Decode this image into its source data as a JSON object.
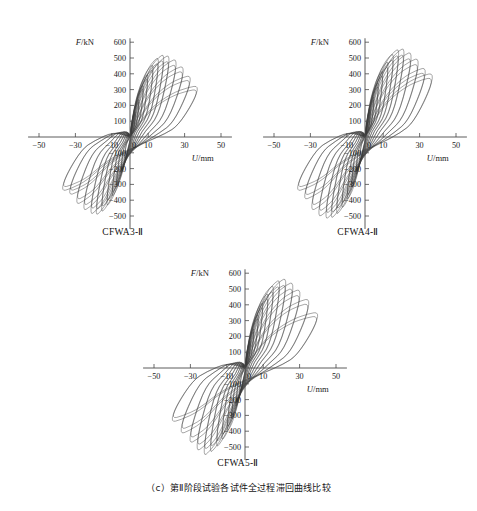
{
  "figure": {
    "caption": "（c）第Ⅱ阶段试验各试件全过程滞回曲线比较",
    "caption_label": "(c)",
    "background": "#ffffff",
    "line_color": "#3a3a3a",
    "axis_color": "#4a4a4a"
  },
  "panels": [
    {
      "id": "a",
      "title": "CFWA3-Ⅱ"
    },
    {
      "id": "b",
      "title": "CFWA4-Ⅱ"
    },
    {
      "id": "c",
      "title": "CFWA5-Ⅱ"
    }
  ],
  "axes": {
    "y_title": "F/kN",
    "x_title": "U/mm",
    "y_ticks": [
      600,
      500,
      400,
      300,
      200,
      100,
      -100,
      -200,
      -300,
      -400,
      -500,
      -600
    ],
    "y_tick_labels": [
      "600",
      "500",
      "400",
      "300",
      "200",
      "100",
      "-100",
      "-200",
      "-300",
      "-400",
      "-500",
      "-600"
    ],
    "x_ticks": [
      -50,
      -30,
      -10,
      0,
      10,
      30,
      50
    ],
    "x_tick_labels": [
      "-50",
      "-30",
      "-10",
      "0",
      "10",
      "30",
      "50"
    ],
    "xlim": [
      -55,
      55
    ],
    "ylim": [
      -620,
      620
    ]
  },
  "chart_data": [
    {
      "type": "line",
      "title": "CFWA3-Ⅱ",
      "xlabel": "U/mm",
      "ylabel": "F/kN",
      "xlim": [
        -55,
        55
      ],
      "ylim": [
        -620,
        620
      ],
      "grid": false,
      "legend": "none",
      "description": "Full-process hysteretic load-displacement loops, stage II test",
      "loops": [
        {
          "cycle": 1,
          "peak_disp_pos": 3.0,
          "peak_force_pos": 160,
          "peak_disp_neg": -3.0,
          "peak_force_neg": -150
        },
        {
          "cycle": 2,
          "peak_disp_pos": 5.0,
          "peak_force_pos": 240,
          "peak_disp_neg": -5.0,
          "peak_force_neg": -230
        },
        {
          "cycle": 3,
          "peak_disp_pos": 7.5,
          "peak_force_pos": 330,
          "peak_disp_neg": -7.5,
          "peak_force_neg": -310
        },
        {
          "cycle": 4,
          "peak_disp_pos": 10.0,
          "peak_force_pos": 400,
          "peak_disp_neg": -10.0,
          "peak_force_neg": -380
        },
        {
          "cycle": 5,
          "peak_disp_pos": 13.0,
          "peak_force_pos": 460,
          "peak_disp_neg": -13.0,
          "peak_force_neg": -440
        },
        {
          "cycle": 6,
          "peak_disp_pos": 16.0,
          "peak_force_pos": 505,
          "peak_disp_neg": -16.0,
          "peak_force_neg": -480
        },
        {
          "cycle": 7,
          "peak_disp_pos": 19.0,
          "peak_force_pos": 525,
          "peak_disp_neg": -19.0,
          "peak_force_neg": -500
        },
        {
          "cycle": 8,
          "peak_disp_pos": 22.0,
          "peak_force_pos": 520,
          "peak_disp_neg": -22.0,
          "peak_force_neg": -495
        },
        {
          "cycle": 9,
          "peak_disp_pos": 26.0,
          "peak_force_pos": 495,
          "peak_disp_neg": -26.0,
          "peak_force_neg": -470
        },
        {
          "cycle": 10,
          "peak_disp_pos": 30.0,
          "peak_force_pos": 450,
          "peak_disp_neg": -30.0,
          "peak_force_neg": -430
        },
        {
          "cycle": 11,
          "peak_disp_pos": 34.0,
          "peak_force_pos": 390,
          "peak_disp_neg": -34.0,
          "peak_force_neg": -370
        },
        {
          "cycle": 12,
          "peak_disp_pos": 38.0,
          "peak_force_pos": 325,
          "peak_disp_neg": -38.0,
          "peak_force_neg": -345
        }
      ],
      "max_force": 525,
      "min_force": -500,
      "max_disp": 38,
      "min_disp": -38
    },
    {
      "type": "line",
      "title": "CFWA4-Ⅱ",
      "xlabel": "U/mm",
      "ylabel": "F/kN",
      "xlim": [
        -55,
        55
      ],
      "ylim": [
        -620,
        620
      ],
      "grid": false,
      "legend": "none",
      "description": "Full-process hysteretic load-displacement loops, stage II test",
      "loops": [
        {
          "cycle": 1,
          "peak_disp_pos": 3.0,
          "peak_force_pos": 175,
          "peak_disp_neg": -3.0,
          "peak_force_neg": -160
        },
        {
          "cycle": 2,
          "peak_disp_pos": 5.0,
          "peak_force_pos": 255,
          "peak_disp_neg": -5.0,
          "peak_force_neg": -240
        },
        {
          "cycle": 3,
          "peak_disp_pos": 7.5,
          "peak_force_pos": 345,
          "peak_disp_neg": -7.5,
          "peak_force_neg": -325
        },
        {
          "cycle": 4,
          "peak_disp_pos": 10.0,
          "peak_force_pos": 420,
          "peak_disp_neg": -10.0,
          "peak_force_neg": -400
        },
        {
          "cycle": 5,
          "peak_disp_pos": 13.0,
          "peak_force_pos": 480,
          "peak_disp_neg": -13.0,
          "peak_force_neg": -455
        },
        {
          "cycle": 6,
          "peak_disp_pos": 16.0,
          "peak_force_pos": 530,
          "peak_disp_neg": -16.0,
          "peak_force_neg": -495
        },
        {
          "cycle": 7,
          "peak_disp_pos": 19.0,
          "peak_force_pos": 560,
          "peak_disp_neg": -19.0,
          "peak_force_neg": -520
        },
        {
          "cycle": 8,
          "peak_disp_pos": 22.0,
          "peak_force_pos": 565,
          "peak_disp_neg": -22.0,
          "peak_force_neg": -525
        },
        {
          "cycle": 9,
          "peak_disp_pos": 26.0,
          "peak_force_pos": 540,
          "peak_disp_neg": -26.0,
          "peak_force_neg": -510
        },
        {
          "cycle": 10,
          "peak_disp_pos": 30.0,
          "peak_force_pos": 500,
          "peak_disp_neg": -30.0,
          "peak_force_neg": -470
        },
        {
          "cycle": 11,
          "peak_disp_pos": 34.0,
          "peak_force_pos": 440,
          "peak_disp_neg": -34.0,
          "peak_force_neg": -400
        },
        {
          "cycle": 12,
          "peak_disp_pos": 38.0,
          "peak_force_pos": 405,
          "peak_disp_neg": -38.0,
          "peak_force_neg": -345
        }
      ],
      "max_force": 565,
      "min_force": -525,
      "max_disp": 38,
      "min_disp": -38
    },
    {
      "type": "line",
      "title": "CFWA5-Ⅱ",
      "xlabel": "U/mm",
      "ylabel": "F/kN",
      "xlim": [
        -55,
        55
      ],
      "ylim": [
        -620,
        620
      ],
      "grid": false,
      "legend": "none",
      "description": "Full-process hysteretic load-displacement loops, stage II test",
      "loops": [
        {
          "cycle": 1,
          "peak_disp_pos": 3.0,
          "peak_force_pos": 170,
          "peak_disp_neg": -3.0,
          "peak_force_neg": -165
        },
        {
          "cycle": 2,
          "peak_disp_pos": 5.0,
          "peak_force_pos": 250,
          "peak_disp_neg": -5.0,
          "peak_force_neg": -245
        },
        {
          "cycle": 3,
          "peak_disp_pos": 7.5,
          "peak_force_pos": 340,
          "peak_disp_neg": -7.5,
          "peak_force_neg": -330
        },
        {
          "cycle": 4,
          "peak_disp_pos": 10.0,
          "peak_force_pos": 415,
          "peak_disp_neg": -10.0,
          "peak_force_neg": -405
        },
        {
          "cycle": 5,
          "peak_disp_pos": 13.0,
          "peak_force_pos": 475,
          "peak_disp_neg": -13.0,
          "peak_force_neg": -460
        },
        {
          "cycle": 6,
          "peak_disp_pos": 16.0,
          "peak_force_pos": 525,
          "peak_disp_neg": -16.0,
          "peak_force_neg": -505
        },
        {
          "cycle": 7,
          "peak_disp_pos": 19.5,
          "peak_force_pos": 560,
          "peak_disp_neg": -19.5,
          "peak_force_neg": -540
        },
        {
          "cycle": 8,
          "peak_disp_pos": 23.0,
          "peak_force_pos": 570,
          "peak_disp_neg": -23.0,
          "peak_force_neg": -560
        },
        {
          "cycle": 9,
          "peak_disp_pos": 27.0,
          "peak_force_pos": 545,
          "peak_disp_neg": -27.0,
          "peak_force_neg": -530
        },
        {
          "cycle": 10,
          "peak_disp_pos": 31.0,
          "peak_force_pos": 500,
          "peak_disp_neg": -31.0,
          "peak_force_neg": -480
        },
        {
          "cycle": 11,
          "peak_disp_pos": 36.0,
          "peak_force_pos": 440,
          "peak_disp_neg": -36.0,
          "peak_force_neg": -420
        },
        {
          "cycle": 12,
          "peak_disp_pos": 41.0,
          "peak_force_pos": 355,
          "peak_disp_neg": -41.0,
          "peak_force_neg": -345
        }
      ],
      "max_force": 570,
      "min_force": -560,
      "max_disp": 41,
      "min_disp": -41
    }
  ]
}
